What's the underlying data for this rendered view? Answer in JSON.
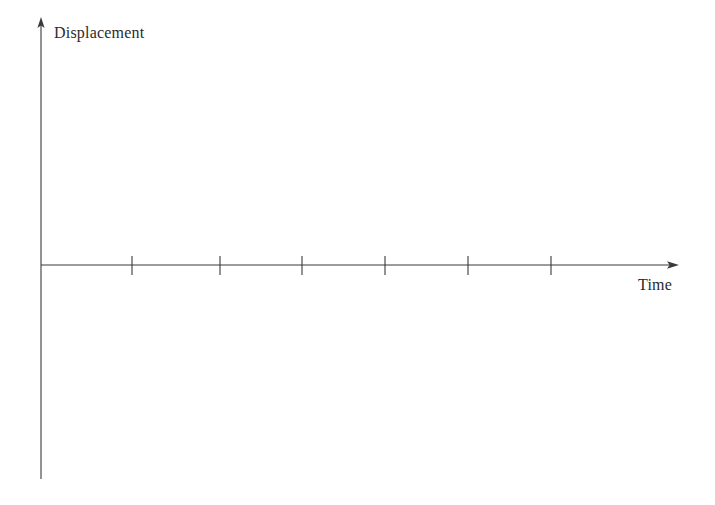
{
  "figure": {
    "background_color": "#ffffff",
    "line_color": "#3a3a3a",
    "width": 715,
    "height": 505
  },
  "labels": {
    "y_axis": "Displacement",
    "x_axis": "Time"
  },
  "chart_data": {
    "type": "line",
    "title": "",
    "subtitle": "",
    "xlabel": "Time",
    "ylabel": "Displacement",
    "series": [
      {
        "name": "",
        "x": [],
        "values": []
      }
    ],
    "x_tick_labels": [
      "",
      "",
      "",
      "",
      "",
      ""
    ],
    "y_tick_labels": [],
    "x_tick_positions_px": [
      132,
      220,
      302,
      385,
      468,
      551
    ],
    "xlim": [
      0,
      6.5
    ],
    "ylim": [
      -2.4,
      2.8
    ],
    "grid": false,
    "legend": null,
    "annotations": []
  },
  "geometry": {
    "origin": {
      "x": 41,
      "y": 265
    },
    "y_axis": {
      "x": 41,
      "top": 18,
      "bottom": 479,
      "arrow": "up"
    },
    "x_axis": {
      "y": 265,
      "left": 41,
      "right": 678,
      "arrow": "right"
    },
    "ticks": {
      "count": 6,
      "positions": [
        132,
        220,
        302,
        385,
        468,
        551
      ],
      "top": 256,
      "bottom": 275
    }
  }
}
